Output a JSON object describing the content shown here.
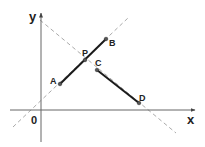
{
  "diagram": {
    "type": "coordinate-geometry",
    "axes": {
      "x_label": "x",
      "y_label": "y",
      "origin_label": "0"
    },
    "points": [
      {
        "name": "A",
        "x": 60,
        "y": 84
      },
      {
        "name": "P",
        "x": 85,
        "y": 60
      },
      {
        "name": "B",
        "x": 106,
        "y": 39
      },
      {
        "name": "C",
        "x": 97,
        "y": 70
      },
      {
        "name": "D",
        "x": 139,
        "y": 103
      }
    ],
    "segments": [
      {
        "from": "A",
        "to": "B",
        "style": "solid"
      },
      {
        "from": "C",
        "to": "D",
        "style": "solid"
      }
    ],
    "dashed_lines": [
      {
        "through": [
          "A",
          "B"
        ]
      },
      {
        "through": [
          "C",
          "D"
        ]
      }
    ],
    "colors": {
      "segment": "#1a1a1a",
      "axis": "#666666",
      "dashed": "#aaaaaa",
      "point": "#555555"
    }
  }
}
